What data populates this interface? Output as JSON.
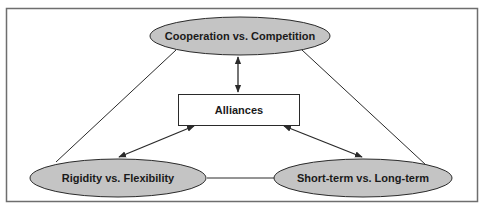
{
  "diagram": {
    "center": {
      "label": "Alliances"
    },
    "nodes": [
      {
        "id": "top",
        "label": "Cooperation vs. Competition"
      },
      {
        "id": "bottom-left",
        "label": "Rigidity vs. Flexibility"
      },
      {
        "id": "bottom-right",
        "label": "Short-term vs. Long-term"
      }
    ],
    "edges": [
      {
        "from": "top",
        "to": "center",
        "type": "bidirectional-arrow"
      },
      {
        "from": "bottom-left",
        "to": "center",
        "type": "bidirectional-arrow"
      },
      {
        "from": "bottom-right",
        "to": "center",
        "type": "bidirectional-arrow"
      },
      {
        "from": "top",
        "to": "bottom-left",
        "type": "line"
      },
      {
        "from": "top",
        "to": "bottom-right",
        "type": "line"
      },
      {
        "from": "bottom-left",
        "to": "bottom-right",
        "type": "line"
      }
    ],
    "colors": {
      "ellipse_fill": "#c4c4c4",
      "stroke": "#2a2a2a",
      "frame": "#6e6e6e"
    }
  }
}
